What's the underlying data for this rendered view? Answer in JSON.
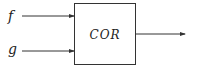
{
  "diagram": {
    "block": {
      "label": "COR"
    },
    "inputs": [
      {
        "label": "f"
      },
      {
        "label": "g"
      }
    ],
    "output": {
      "label": ""
    },
    "colors": {
      "stroke": "#333333",
      "background": "#ffffff"
    }
  }
}
